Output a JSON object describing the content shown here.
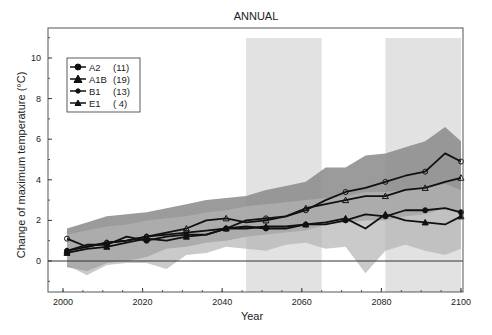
{
  "chart_data": {
    "type": "line",
    "title": "ANNUAL",
    "xlabel": "Year",
    "ylabel": "Change of maximum temperature  (°C)",
    "xlim": [
      1997,
      2104
    ],
    "ylim": [
      -1.5,
      11.5
    ],
    "xticks": [
      2000,
      2020,
      2040,
      2060,
      2080,
      2100
    ],
    "yticks": [
      0,
      2,
      4,
      6,
      8,
      10
    ],
    "grid": false,
    "legend_position": "upper-left",
    "reference_line": 0,
    "shaded_periods": [
      {
        "start": 2046,
        "end": 2065
      },
      {
        "start": 2081,
        "end": 2100
      }
    ],
    "x": [
      2001,
      2006,
      2011,
      2016,
      2021,
      2026,
      2031,
      2036,
      2041,
      2046,
      2051,
      2056,
      2061,
      2066,
      2071,
      2076,
      2081,
      2086,
      2091,
      2096,
      2100
    ],
    "series": [
      {
        "name": "A2",
        "models": 11,
        "marker": "circle-open",
        "values": [
          1.1,
          0.7,
          0.9,
          1.0,
          1.2,
          1.3,
          1.4,
          1.5,
          1.6,
          2.0,
          2.1,
          2.2,
          2.5,
          3.0,
          3.4,
          3.6,
          3.9,
          4.2,
          4.4,
          5.3,
          4.9
        ]
      },
      {
        "name": "A1B",
        "models": 19,
        "marker": "triangle-open",
        "values": [
          0.5,
          0.7,
          0.9,
          1.0,
          1.2,
          1.4,
          1.6,
          2.0,
          2.1,
          1.9,
          2.0,
          2.2,
          2.6,
          2.8,
          3.0,
          3.2,
          3.2,
          3.5,
          3.6,
          3.9,
          4.1
        ]
      },
      {
        "name": "B1",
        "models": 13,
        "marker": "circle-filled",
        "values": [
          0.5,
          0.8,
          0.8,
          1.2,
          1.0,
          1.2,
          1.3,
          1.3,
          1.6,
          1.7,
          1.6,
          1.6,
          1.8,
          1.8,
          2.0,
          2.3,
          2.2,
          2.5,
          2.5,
          2.6,
          2.4
        ]
      },
      {
        "name": "E1",
        "models": 4,
        "marker": "triangle-filled",
        "values": [
          0.4,
          0.6,
          0.7,
          0.9,
          1.1,
          1.0,
          1.2,
          1.3,
          1.6,
          1.6,
          1.7,
          1.7,
          1.8,
          1.9,
          2.1,
          1.6,
          2.3,
          2.0,
          1.9,
          1.8,
          2.2
        ]
      }
    ],
    "bands": [
      {
        "name": "A2/A1B range",
        "color": "#8a8a8a",
        "upper": [
          1.6,
          1.9,
          2.2,
          2.3,
          2.4,
          2.6,
          2.8,
          3.0,
          3.1,
          3.2,
          3.5,
          3.7,
          3.9,
          4.6,
          4.6,
          5.2,
          5.3,
          5.6,
          5.9,
          6.6,
          5.9
        ],
        "lower": [
          -0.3,
          -0.5,
          -0.1,
          0.0,
          0.2,
          0.6,
          0.7,
          0.9,
          1.0,
          1.2,
          1.3,
          1.4,
          1.5,
          1.8,
          1.9,
          2.0,
          2.0,
          2.2,
          2.3,
          2.6,
          2.3
        ]
      },
      {
        "name": "B1/E1 range",
        "color": "#b4b4b4",
        "upper": [
          1.3,
          1.5,
          1.7,
          1.8,
          2.0,
          2.1,
          2.2,
          2.4,
          2.5,
          2.7,
          2.8,
          2.9,
          3.0,
          3.1,
          3.2,
          3.4,
          3.4,
          3.5,
          3.6,
          3.8,
          3.5
        ],
        "lower": [
          -0.2,
          -0.7,
          -0.2,
          -0.1,
          -0.1,
          -0.4,
          0.3,
          0.4,
          0.7,
          0.6,
          0.5,
          0.8,
          0.9,
          0.6,
          0.7,
          -0.6,
          0.5,
          0.8,
          0.5,
          0.3,
          0.6
        ]
      }
    ]
  },
  "legend": {
    "items": [
      {
        "label": "A2",
        "count": "(11)"
      },
      {
        "label": "A1B",
        "count": "(19)"
      },
      {
        "label": "B1",
        "count": "(13)"
      },
      {
        "label": "E1",
        "count": "( 4)"
      }
    ]
  },
  "colors": {
    "shade": "#e2e2e2",
    "band_dark": "#8a8a8a",
    "band_light": "#b4b4b4",
    "line": "#111111",
    "axis": "#333333"
  }
}
